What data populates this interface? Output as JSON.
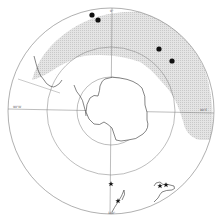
{
  "map": {
    "projection": "south-polar-stereographic",
    "center": [
      111,
      111
    ],
    "circles": [
      {
        "name": "outer-latitude-circle",
        "r": 103
      },
      {
        "name": "middle-latitude-circle",
        "r": 64
      },
      {
        "name": "inner-latitude-circle",
        "r": 34
      }
    ],
    "meridian_labels": {
      "top": "0°",
      "left": "90°W",
      "right": "90°E",
      "bottom": "180°"
    },
    "colors": {
      "background": "#ffffff",
      "line": "#7a7a7a",
      "coast": "#333333",
      "shading": "#d9d9d9",
      "marker": "#111111"
    },
    "legend_symbols": {
      "dot": "filled-circle-record",
      "star": "star-record"
    },
    "dot_markers": [
      {
        "x": 92,
        "y": 15
      },
      {
        "x": 98,
        "y": 20
      },
      {
        "x": 159,
        "y": 49
      },
      {
        "x": 172,
        "y": 61
      }
    ],
    "star_markers": [
      {
        "x": 111,
        "y": 184
      },
      {
        "x": 118,
        "y": 201
      },
      {
        "x": 160,
        "y": 186
      },
      {
        "x": 166,
        "y": 185
      }
    ],
    "regions": [
      "Antarctica",
      "South America",
      "New Zealand",
      "Australia"
    ]
  }
}
